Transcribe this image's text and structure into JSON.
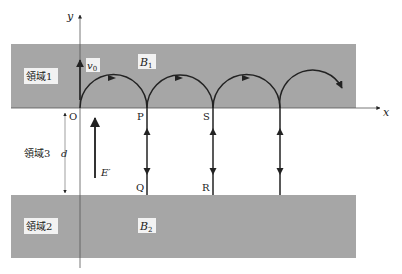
{
  "figure": {
    "axes": {
      "x_label": "x",
      "y_label": "y",
      "origin_label": "O"
    },
    "regions": [
      {
        "id": "region1",
        "label": "領域1",
        "field_label": "B",
        "field_sub": "1"
      },
      {
        "id": "region2",
        "label": "領域2",
        "field_label": "B",
        "field_sub": "2"
      },
      {
        "id": "region3",
        "label": "領域3",
        "gap_label": "d"
      }
    ],
    "points": [
      "O",
      "P",
      "S",
      "Q",
      "R"
    ],
    "velocity": {
      "label": "v",
      "sub": "0"
    },
    "electric_field": {
      "label": "E′"
    },
    "colors": {
      "region_fill": "#a6a6a6",
      "line": "#222222",
      "background": "#ffffff"
    }
  }
}
